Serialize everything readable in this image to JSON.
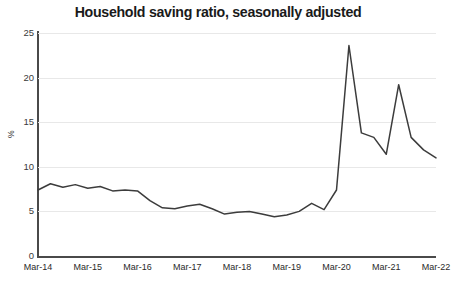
{
  "chart_data": {
    "type": "line",
    "title": "Household saving ratio, seasonally adjusted",
    "xlabel": "",
    "ylabel": "%",
    "ylim": [
      0,
      25
    ],
    "yticks": [
      0,
      5,
      10,
      15,
      20,
      25
    ],
    "grid": true,
    "legend": "none",
    "xtick_labels": [
      "Mar-14",
      "Mar-15",
      "Mar-16",
      "Mar-17",
      "Mar-18",
      "Mar-19",
      "Mar-20",
      "Mar-21",
      "Mar-22"
    ],
    "x": [
      "Mar-14",
      "Jun-14",
      "Sep-14",
      "Dec-14",
      "Mar-15",
      "Jun-15",
      "Sep-15",
      "Dec-15",
      "Mar-16",
      "Jun-16",
      "Sep-16",
      "Dec-16",
      "Mar-17",
      "Jun-17",
      "Sep-17",
      "Dec-17",
      "Mar-18",
      "Jun-18",
      "Sep-18",
      "Dec-18",
      "Mar-19",
      "Jun-19",
      "Sep-19",
      "Dec-19",
      "Mar-20",
      "Jun-20",
      "Sep-20",
      "Dec-20",
      "Mar-21",
      "Jun-21",
      "Sep-21",
      "Dec-21",
      "Mar-22"
    ],
    "values": [
      7.4,
      8.1,
      7.7,
      8.0,
      7.6,
      7.8,
      7.3,
      7.4,
      7.3,
      6.2,
      5.4,
      5.3,
      5.6,
      5.8,
      5.3,
      4.7,
      4.9,
      5.0,
      4.7,
      4.4,
      4.6,
      5.0,
      5.9,
      5.2,
      7.4,
      23.6,
      13.8,
      13.3,
      11.4,
      19.2,
      13.3,
      11.9,
      11.0
    ],
    "series_color": "#3c3c3c",
    "grid_color": "#e8e8e8",
    "axis_color": "#4a4a4a"
  }
}
